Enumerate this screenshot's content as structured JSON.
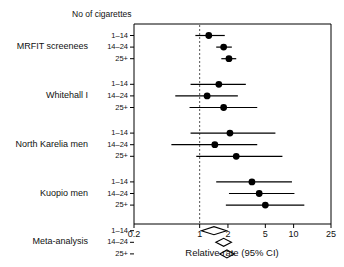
{
  "figure": {
    "column_header": "No of cigarettes",
    "axis_title": "Relative rate (95% CI)",
    "reference_line_value": 1
  },
  "chart_data": {
    "type": "scatter",
    "title": "",
    "xlabel": "Relative rate (95% CI)",
    "ylabel": "",
    "xscale": "log",
    "xlim": [
      0.2,
      25
    ],
    "xticks": [
      0.2,
      1,
      2,
      5,
      10,
      25
    ],
    "xtick_labels": [
      "0.2",
      "1",
      "2",
      "5",
      "10",
      "25"
    ],
    "grid": false,
    "legend": null,
    "reference_line": 1,
    "column_header": "No of cigarettes",
    "groups": [
      {
        "study": "MRFIT screenees",
        "rows": [
          {
            "dose": "1–14",
            "estimate": 1.25,
            "ci_low": 0.9,
            "ci_high": 1.85,
            "marker": "square-dot"
          },
          {
            "dose": "14–24",
            "estimate": 1.8,
            "ci_low": 1.5,
            "ci_high": 2.2,
            "marker": "square-dot"
          },
          {
            "dose": "25+",
            "estimate": 2.05,
            "ci_low": 1.7,
            "ci_high": 2.45,
            "marker": "square-dot"
          }
        ]
      },
      {
        "study": "Whitehall I",
        "rows": [
          {
            "dose": "1–14",
            "estimate": 1.6,
            "ci_low": 0.8,
            "ci_high": 3.1,
            "marker": "square-dot"
          },
          {
            "dose": "14–24",
            "estimate": 1.2,
            "ci_low": 0.55,
            "ci_high": 2.55,
            "marker": "square-dot"
          },
          {
            "dose": "25+",
            "estimate": 1.8,
            "ci_low": 0.78,
            "ci_high": 4.1,
            "marker": "square-dot"
          }
        ]
      },
      {
        "study": "North Karelia men",
        "rows": [
          {
            "dose": "1–14",
            "estimate": 2.1,
            "ci_low": 0.8,
            "ci_high": 6.4,
            "marker": "square-dot"
          },
          {
            "dose": "14–24",
            "estimate": 1.45,
            "ci_low": 0.5,
            "ci_high": 4.1,
            "marker": "square-dot"
          },
          {
            "dose": "25+",
            "estimate": 2.45,
            "ci_low": 0.92,
            "ci_high": 7.6,
            "marker": "square-dot"
          }
        ]
      },
      {
        "study": "Kuopio men",
        "rows": [
          {
            "dose": "1–14",
            "estimate": 3.6,
            "ci_low": 1.5,
            "ci_high": 9.6,
            "marker": "square-dot"
          },
          {
            "dose": "14–24",
            "estimate": 4.3,
            "ci_low": 2.05,
            "ci_high": 10.2,
            "marker": "square-dot"
          },
          {
            "dose": "25+",
            "estimate": 5.0,
            "ci_low": 1.9,
            "ci_high": 13.0,
            "marker": "square-dot"
          }
        ]
      },
      {
        "study": "Meta-analysis",
        "rows": [
          {
            "dose": "1–14",
            "estimate": 1.42,
            "ci_low": 1.05,
            "ci_high": 1.95,
            "marker": "diamond"
          },
          {
            "dose": "14–24",
            "estimate": 1.8,
            "ci_low": 1.5,
            "ci_high": 2.2,
            "marker": "diamond"
          },
          {
            "dose": "25+",
            "estimate": 1.95,
            "ci_low": 1.65,
            "ci_high": 2.35,
            "marker": "diamond"
          }
        ]
      }
    ]
  },
  "colors": {
    "marker": "#000000",
    "frame": "#000000",
    "reference": "#555555",
    "text": "#111111"
  }
}
